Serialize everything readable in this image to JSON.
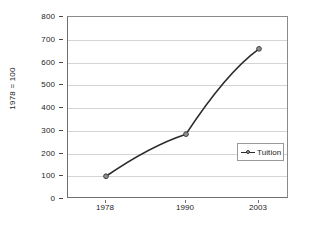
{
  "chart_data": {
    "type": "line",
    "title": "",
    "xlabel": "",
    "ylabel": "1978 = 100",
    "categories": [
      "1978",
      "1990",
      "2003"
    ],
    "series": [
      {
        "name": "Tuition",
        "values": [
          100,
          285,
          660
        ]
      }
    ],
    "ylim": [
      0,
      800
    ],
    "y_ticks": [
      0,
      100,
      200,
      300,
      400,
      500,
      600,
      700,
      800
    ],
    "y_tick_labels": [
      "0",
      "100",
      "200",
      "300",
      "400",
      "500",
      "600",
      "700",
      "800"
    ],
    "x_tick_labels": [
      "1978",
      "1990",
      "2003"
    ],
    "grid": "horizontal",
    "legend_position": "center-right",
    "legend_entries": [
      "Tuition"
    ],
    "colors": {
      "line": "#2b2b2b",
      "marker_fill": "#8d8d8d",
      "marker_edge": "#3a3a3a",
      "gridline": "#d4d4d4",
      "axis": "#6f6f6f",
      "background": "#ffffff",
      "text": "#1c1c1c"
    }
  },
  "legend": {
    "tuition_label": "Tuition"
  },
  "axes": {
    "y_title": "1978 = 100"
  }
}
